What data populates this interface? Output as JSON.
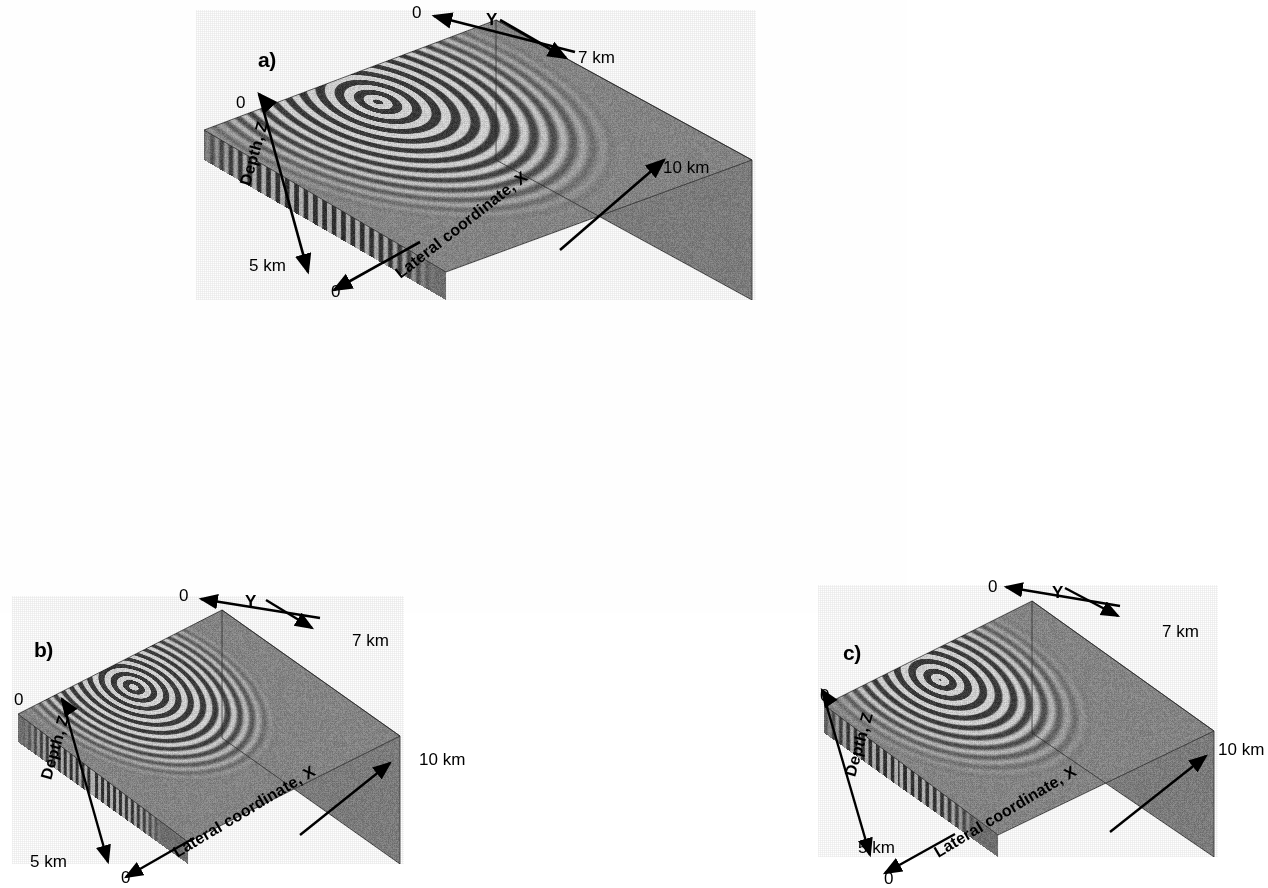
{
  "figure": {
    "background_color": "#ffffff",
    "ink_color": "#000000"
  },
  "panels": [
    {
      "id": "a",
      "label": "a)",
      "axes": {
        "depth": {
          "title": "Depth, Z",
          "min_tick": "0",
          "max_tick": "5 km"
        },
        "lateral": {
          "title": "Lateral coordinate, X",
          "min_tick": "0",
          "max_tick": "10 km"
        },
        "y": {
          "title": "Y",
          "min_tick": "0",
          "max_tick": "7 km"
        }
      }
    },
    {
      "id": "b",
      "label": "b)",
      "axes": {
        "depth": {
          "title": "Depth, Z",
          "min_tick": "0",
          "max_tick": "5 km"
        },
        "lateral": {
          "title": "Lateral coordinate, X",
          "min_tick": "0",
          "max_tick": "10 km"
        },
        "y": {
          "title": "Y",
          "min_tick": "0",
          "max_tick": "7 km"
        }
      }
    },
    {
      "id": "c",
      "label": "c)",
      "axes": {
        "depth": {
          "title": "Depth, Z",
          "min_tick": "0",
          "max_tick": "5 km"
        },
        "lateral": {
          "title": "Lateral coordinate, X",
          "min_tick": "0",
          "max_tick": "10 km"
        },
        "y": {
          "title": "Y",
          "min_tick": "0",
          "max_tick": "7 km"
        }
      }
    }
  ],
  "chart_data": {
    "type": "heatmap",
    "subtitle": "",
    "panel_count": 3,
    "panel_ids": [
      "a",
      "b",
      "c"
    ],
    "colormap": "grayscale",
    "rendering": "three orthogonal cross-sections of a 3-D scalar wavefield; concentric oscillatory wavefronts radiating from a buried point source",
    "xlabel": "Lateral coordinate, X",
    "ylabel": "Depth, Z",
    "zlabel": "Y",
    "xlim": [
      0,
      10
    ],
    "ylim": [
      0,
      5
    ],
    "zlim": [
      0,
      7
    ],
    "x_units": "km",
    "y_units": "km",
    "z_units": "km",
    "xticks": [
      "0",
      "10 km"
    ],
    "yticks": [
      "0",
      "5 km"
    ],
    "zticks": [
      "0",
      "7 km"
    ],
    "grid": false,
    "legend": "none",
    "series": [
      {
        "name": "a",
        "panel": "a",
        "source_xy": [
          4.3,
          6.1
        ],
        "source_depth_km": 0.3,
        "wavelength_km": 0.42,
        "num_visible_wavefronts": 13,
        "description": "Wavefield snapshot with tight, high-contrast concentric fringes; strongest amplitude near source; clear truncation at the vertical Y-plane."
      },
      {
        "name": "b",
        "panel": "b",
        "source_xy": [
          4.1,
          6.0
        ],
        "source_depth_km": 0.3,
        "wavelength_km": 0.4,
        "num_visible_wavefronts": 12,
        "description": "Wavefield snapshot with dense near-vertical striping on the X-Z face and concentric fringes on the top face."
      },
      {
        "name": "c",
        "panel": "c",
        "source_xy": [
          4.0,
          6.0
        ],
        "source_depth_km": 0.3,
        "wavelength_km": 0.44,
        "num_visible_wavefronts": 11,
        "description": "Wavefield snapshot with broader, smoother concentric fringes indicating a later propagation time."
      }
    ],
    "annotations": [
      {
        "text": "a)",
        "panel": "a"
      },
      {
        "text": "b)",
        "panel": "b"
      },
      {
        "text": "c)",
        "panel": "c"
      }
    ]
  }
}
